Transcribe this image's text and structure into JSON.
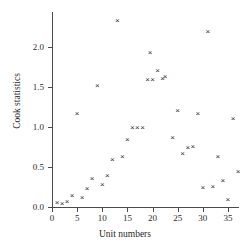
{
  "chart_data": {
    "type": "scatter",
    "title": "",
    "xlabel": "Unit numbers",
    "ylabel": "Cook statistics",
    "xlim": [
      0,
      37
    ],
    "ylim": [
      0.0,
      2.45
    ],
    "grid": false,
    "legend": null,
    "marker": "x",
    "marker_color": "#303030",
    "xticks": [
      0,
      5,
      10,
      15,
      20,
      25,
      30,
      35
    ],
    "xtick_labels": [
      "0",
      "5",
      "10",
      "15",
      "20",
      "25",
      "30",
      "35"
    ],
    "yticks": [
      0.0,
      0.5,
      1.0,
      1.5,
      2.0
    ],
    "ytick_labels": [
      "0.0",
      "0.5",
      "1.0",
      "1.5",
      "2.0"
    ],
    "x": [
      1,
      2,
      3,
      4,
      5,
      6,
      7,
      8,
      9,
      10,
      11,
      12,
      13,
      14,
      15,
      16,
      17,
      18,
      19,
      19.5,
      20,
      21,
      22,
      22.5,
      24,
      25,
      26,
      27,
      28,
      29,
      30,
      31,
      32,
      33,
      34,
      35,
      36,
      37
    ],
    "y": [
      0.06,
      0.05,
      0.07,
      0.15,
      1.17,
      0.12,
      0.23,
      0.36,
      1.52,
      0.28,
      0.39,
      0.6,
      2.33,
      0.63,
      0.85,
      1.0,
      1.0,
      1.0,
      1.6,
      1.93,
      1.6,
      1.71,
      1.61,
      1.63,
      0.87,
      1.21,
      0.67,
      0.74,
      0.76,
      1.17,
      0.25,
      2.2,
      0.26,
      0.63,
      0.33,
      0.09,
      1.11,
      0.45
    ],
    "points": [
      {
        "x": 1,
        "y": 0.06
      },
      {
        "x": 2,
        "y": 0.05
      },
      {
        "x": 3,
        "y": 0.07
      },
      {
        "x": 4,
        "y": 0.15
      },
      {
        "x": 5,
        "y": 1.17
      },
      {
        "x": 6,
        "y": 0.12
      },
      {
        "x": 7,
        "y": 0.23
      },
      {
        "x": 8,
        "y": 0.36
      },
      {
        "x": 9,
        "y": 1.52
      },
      {
        "x": 10,
        "y": 0.28
      },
      {
        "x": 11,
        "y": 0.39
      },
      {
        "x": 12,
        "y": 0.6
      },
      {
        "x": 13,
        "y": 2.33
      },
      {
        "x": 14,
        "y": 0.63
      },
      {
        "x": 15,
        "y": 0.85
      },
      {
        "x": 16,
        "y": 1.0
      },
      {
        "x": 17,
        "y": 1.0
      },
      {
        "x": 18,
        "y": 1.0
      },
      {
        "x": 19,
        "y": 1.6
      },
      {
        "x": 19.5,
        "y": 1.93
      },
      {
        "x": 20,
        "y": 1.6
      },
      {
        "x": 21,
        "y": 1.71
      },
      {
        "x": 22,
        "y": 1.61
      },
      {
        "x": 22.5,
        "y": 1.63
      },
      {
        "x": 24,
        "y": 0.87
      },
      {
        "x": 25,
        "y": 1.21
      },
      {
        "x": 26,
        "y": 0.67
      },
      {
        "x": 27,
        "y": 0.74
      },
      {
        "x": 28,
        "y": 0.76
      },
      {
        "x": 29,
        "y": 1.17
      },
      {
        "x": 30,
        "y": 0.25
      },
      {
        "x": 31,
        "y": 2.2
      },
      {
        "x": 32,
        "y": 0.26
      },
      {
        "x": 33,
        "y": 0.63
      },
      {
        "x": 34,
        "y": 0.33
      },
      {
        "x": 35,
        "y": 0.09
      },
      {
        "x": 36,
        "y": 1.11
      },
      {
        "x": 37,
        "y": 0.45
      }
    ]
  }
}
